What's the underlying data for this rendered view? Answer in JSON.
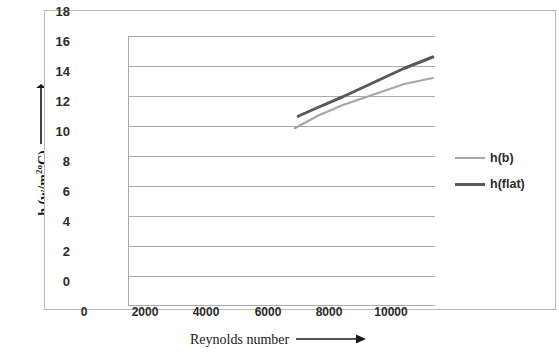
{
  "chart_data": {
    "type": "line",
    "title": "",
    "xlabel": "Reynolds number",
    "ylabel": "h  (w/m2oC)",
    "ylabel_text": "h  (w/m",
    "ylabel_sup": "2o",
    "ylabel_tail": "C)",
    "xlim": [
      0,
      10000
    ],
    "ylim": [
      0,
      18
    ],
    "xticks": [
      0,
      2000,
      4000,
      6000,
      8000,
      10000
    ],
    "yticks": [
      0,
      2,
      4,
      6,
      8,
      10,
      12,
      14,
      16,
      18
    ],
    "xtick_labels": [
      "0",
      "2000",
      "4000",
      "6000",
      "8000",
      "10000"
    ],
    "ytick_labels": [
      "0",
      "2",
      "4",
      "6",
      "8",
      "10",
      "12",
      "14",
      "16",
      "18"
    ],
    "grid": "horizontal",
    "legend_position": "right",
    "series": [
      {
        "name": "h(b)",
        "color": "#a6a6a6",
        "width": 2,
        "x": [
          5430,
          6200,
          7000,
          8000,
          9000,
          9930
        ],
        "values": [
          11.85,
          12.7,
          13.4,
          14.1,
          14.8,
          15.2
        ]
      },
      {
        "name": "h(flat)",
        "color": "#595959",
        "width": 3,
        "x": [
          5540,
          6200,
          7000,
          8000,
          9000,
          9930
        ],
        "values": [
          12.65,
          13.25,
          13.95,
          14.9,
          15.85,
          16.6
        ]
      }
    ]
  },
  "axes": {
    "y_title_arrow": "↑",
    "x_title_arrow": "⟶"
  },
  "legend": {
    "items": [
      {
        "label": "h(b)",
        "style": "s-hb"
      },
      {
        "label": "h(flat)",
        "style": "s-hflat"
      }
    ]
  },
  "colors": {
    "frame": "#b9b9b9",
    "gridline": "#a9a9a9",
    "axis": "#a9a9a9",
    "series_hb": "#a6a6a6",
    "series_hflat": "#595959",
    "text": "#2b2b2b"
  }
}
